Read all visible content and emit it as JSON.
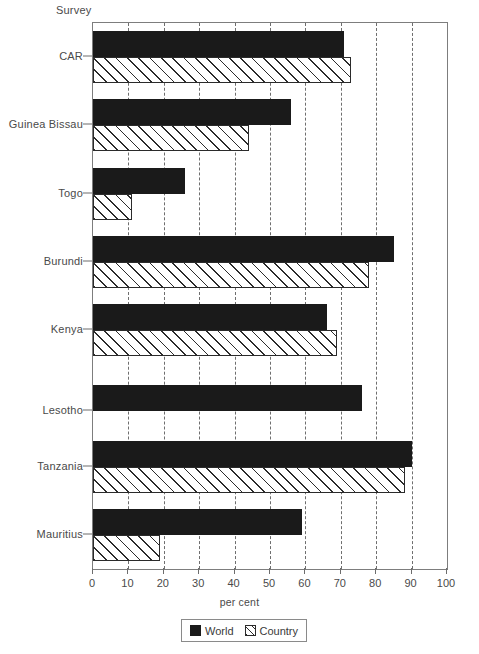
{
  "chart_data": {
    "type": "bar",
    "orientation": "horizontal",
    "title": "",
    "xlabel": "per cent",
    "ylabel": "Survey",
    "xlim": [
      0,
      100
    ],
    "xticks": [
      0,
      10,
      20,
      30,
      40,
      50,
      60,
      70,
      80,
      90,
      100
    ],
    "grid": true,
    "grid_axis": "x",
    "legend_position": "bottom",
    "categories": [
      "CAR",
      "Guinea Bissau",
      "Togo",
      "Burundi",
      "Kenya",
      "Lesotho",
      "Tanzania",
      "Mauritius"
    ],
    "series": [
      {
        "name": "World",
        "style": "solid-black",
        "color": "#1a1a1a",
        "values": [
          71,
          56,
          26,
          85,
          66,
          76,
          90,
          59
        ]
      },
      {
        "name": "Country",
        "style": "hatched",
        "color": "#ffffff",
        "values": [
          73,
          44,
          11,
          78,
          69,
          null,
          88,
          19
        ]
      }
    ]
  },
  "axis": {
    "y_title": "Survey",
    "x_title": "per cent",
    "x_tick_labels": [
      "0",
      "10",
      "20",
      "30",
      "40",
      "50",
      "60",
      "70",
      "80",
      "90",
      "100"
    ]
  },
  "legend": {
    "items": [
      {
        "label": "World",
        "swatch": "solid-black-square-icon"
      },
      {
        "label": "Country",
        "swatch": "hatched-square-icon"
      }
    ]
  }
}
